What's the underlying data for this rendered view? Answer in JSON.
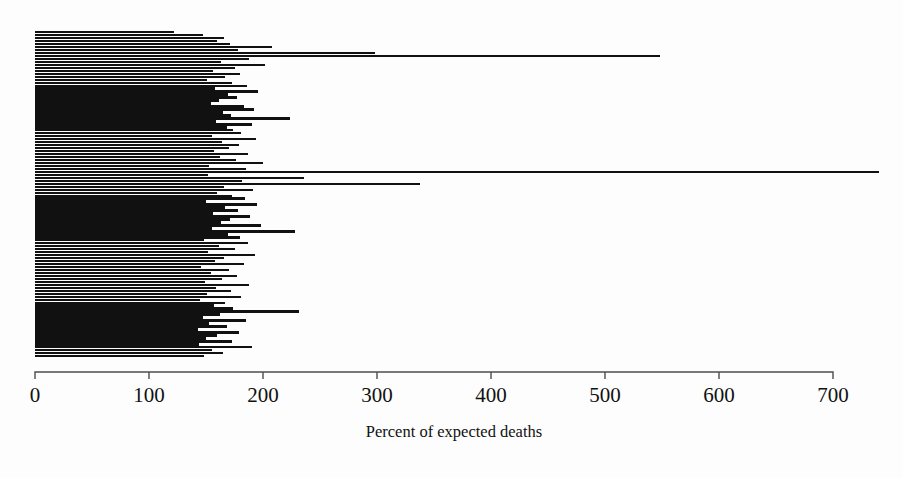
{
  "figure": {
    "background_color": "#fdfdfd",
    "bar_color": "#111111",
    "axis_color": "#4c4c4c"
  },
  "chart_data": {
    "type": "bar",
    "orientation": "horizontal",
    "title": "",
    "subtitle": "",
    "xlabel": "Percent of expected deaths",
    "ylabel": "",
    "xlim": [
      0,
      700
    ],
    "ylim": [
      0,
      110
    ],
    "grid": false,
    "legend": null,
    "xticks": [
      0,
      100,
      200,
      300,
      400,
      500,
      600,
      700
    ],
    "xtick_labels": [
      "0",
      "100",
      "200",
      "300",
      "400",
      "500",
      "600",
      "700"
    ],
    "yticks": [],
    "ytick_labels": [],
    "axis_only_bottom": true,
    "n_bars": 110,
    "reference_value": 100,
    "values": [
      122,
      128,
      131,
      134,
      136,
      138,
      140,
      142,
      143,
      145,
      146,
      147,
      148,
      150,
      151,
      152,
      153,
      154,
      155,
      156,
      157,
      158,
      159,
      160,
      161,
      162,
      163,
      164,
      165,
      166,
      167,
      168,
      169,
      170,
      171,
      172,
      173,
      174,
      175,
      176,
      177,
      178,
      179,
      180,
      181,
      182,
      183,
      184,
      185,
      186,
      187,
      188,
      189,
      190,
      191,
      192,
      193,
      194,
      195,
      196,
      197,
      198,
      199,
      200,
      201,
      202,
      203,
      204,
      205,
      206,
      207,
      208,
      209,
      210,
      212,
      214,
      216,
      218,
      220,
      222,
      225,
      228,
      231,
      233,
      236,
      146,
      148,
      152,
      155,
      158,
      160,
      163,
      166,
      168,
      172,
      176,
      180,
      184,
      188,
      192,
      196,
      200,
      205,
      212,
      220,
      228,
      298,
      338,
      548,
      740
    ],
    "row_order_values": [
      122,
      147,
      166,
      160,
      171,
      208,
      178,
      298,
      548,
      188,
      163,
      202,
      175,
      156,
      180,
      167,
      151,
      173,
      186,
      158,
      196,
      169,
      177,
      161,
      154,
      183,
      192,
      165,
      172,
      224,
      159,
      190,
      168,
      174,
      181,
      155,
      194,
      164,
      179,
      170,
      157,
      187,
      162,
      176,
      200,
      153,
      185,
      740,
      152,
      236,
      182,
      338,
      166,
      191,
      160,
      173,
      184,
      150,
      195,
      167,
      178,
      156,
      189,
      171,
      163,
      198,
      155,
      228,
      169,
      180,
      148,
      187,
      161,
      175,
      152,
      193,
      166,
      158,
      183,
      146,
      170,
      154,
      177,
      164,
      149,
      188,
      159,
      172,
      151,
      181,
      145,
      167,
      157,
      174,
      232,
      162,
      147,
      185,
      153,
      168,
      143,
      179,
      160,
      150,
      173,
      144,
      190,
      155,
      165,
      148
    ]
  },
  "axis": {
    "label": "Percent of expected deaths",
    "tick_0": "0",
    "tick_100": "100",
    "tick_200": "200",
    "tick_300": "300",
    "tick_400": "400",
    "tick_500": "500",
    "tick_600": "600",
    "tick_700": "700"
  }
}
